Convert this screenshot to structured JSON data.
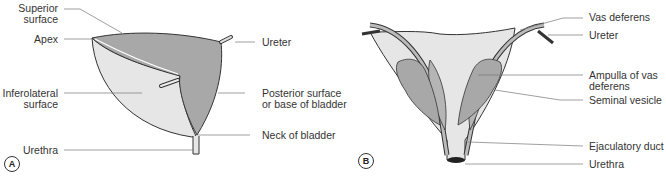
{
  "figure": {
    "panels": [
      {
        "tag": "A",
        "title": "Bladder lateral view",
        "labels": {
          "superior_surface_1": "Superior",
          "superior_surface_2": "surface",
          "apex": "Apex",
          "inferolateral_1": "Inferolateral",
          "inferolateral_2": "surface",
          "urethra": "Urethra",
          "ureter": "Ureter",
          "posterior_1": "Posterior surface",
          "posterior_2": "or base of bladder",
          "neck": "Neck of bladder"
        }
      },
      {
        "tag": "B",
        "title": "Bladder posterior view",
        "labels": {
          "vas_deferens": "Vas deferens",
          "ureter": "Ureter",
          "ampulla_1": "Ampulla of vas",
          "ampulla_2": "deferens",
          "seminal_vesicle": "Seminal vesicle",
          "ejaculatory_duct": "Ejaculatory duct",
          "urethra": "Urethra"
        }
      }
    ],
    "colors": {
      "dark_fill": "#a9a9a9",
      "light_fill": "#e4e4e4",
      "outline": "#333333",
      "leader": "#777777"
    }
  }
}
